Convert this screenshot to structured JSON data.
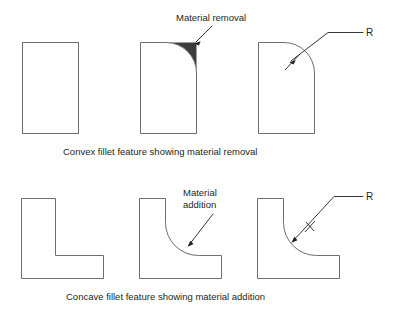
{
  "figure": {
    "background_color": "#ffffff",
    "outline_color": "#6d6e71",
    "shade_color": "#3c3c3c",
    "text_color": "#231f20"
  },
  "top_row": {
    "caption": "Convex fillet feature showing material removal",
    "annotation_label": "Material removal",
    "radius_label": "R",
    "shapes": [
      {
        "name": "plain-rectangle",
        "description": "square corner block"
      },
      {
        "name": "rectangle-with-removed-corner",
        "description": "rounded convex corner with shaded removed material"
      },
      {
        "name": "rectangle-with-fillet-radius",
        "description": "rounded convex corner dimensioned with R"
      }
    ]
  },
  "bottom_row": {
    "caption": "Concave fillet feature showing material addition",
    "annotation_label_line1": "Material",
    "annotation_label_line2": "addition",
    "radius_label": "R",
    "shapes": [
      {
        "name": "plain-l-bracket",
        "description": "sharp inside corner L profile"
      },
      {
        "name": "l-bracket-with-added-material",
        "description": "concave fillet with shaded added material"
      },
      {
        "name": "l-bracket-with-fillet-radius",
        "description": "concave fillet dimensioned with R"
      }
    ]
  }
}
